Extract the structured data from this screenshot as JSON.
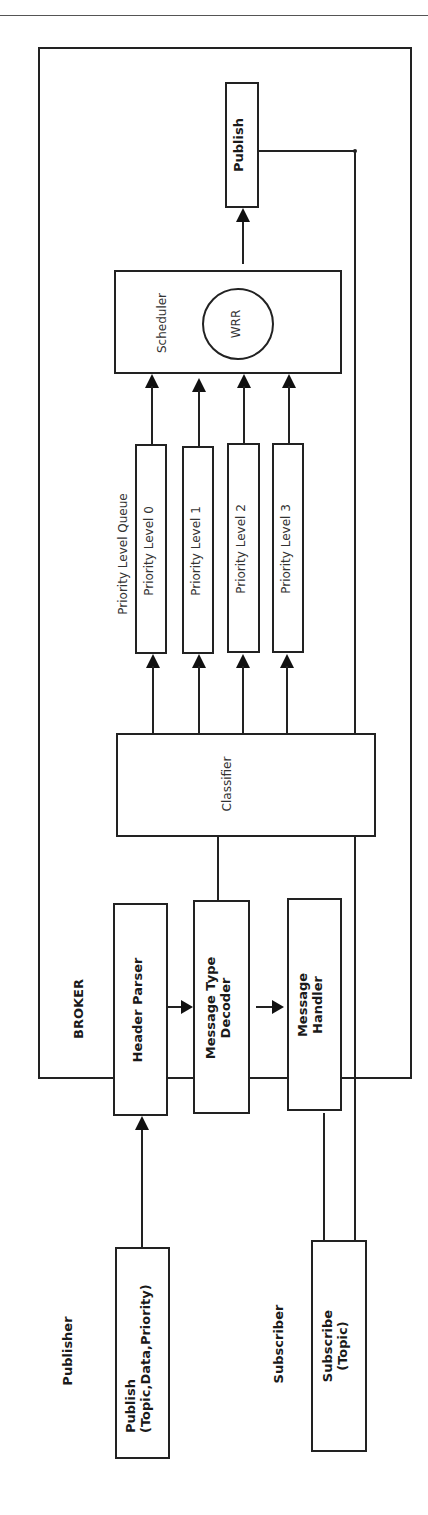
{
  "figure": {
    "broker_label": "BROKER",
    "publisher_label": "Publisher",
    "subscriber_label": "Subscriber",
    "priority_queue_label": "Priority Level Queue",
    "components": {
      "publish_out": "Publish",
      "scheduler": "Scheduler",
      "wrr": "WRR",
      "priority_levels": [
        "Priority Level 0",
        "Priority Level 1",
        "Priority Level 2",
        "Priority Level 3"
      ],
      "classifier": "Classifier",
      "header_parser": "Header Parser",
      "message_type_decoder_line1": "Message Type",
      "message_type_decoder_line2": "Decoder",
      "message_handler_line1": "Message",
      "message_handler_line2": "Handler",
      "publish_in_line1": "Publish",
      "publish_in_line2": "(Topic,Data,Priority)",
      "subscribe_line1": "Subscribe",
      "subscribe_line2": "(Topic)"
    },
    "orientation": "rotated -90deg"
  }
}
